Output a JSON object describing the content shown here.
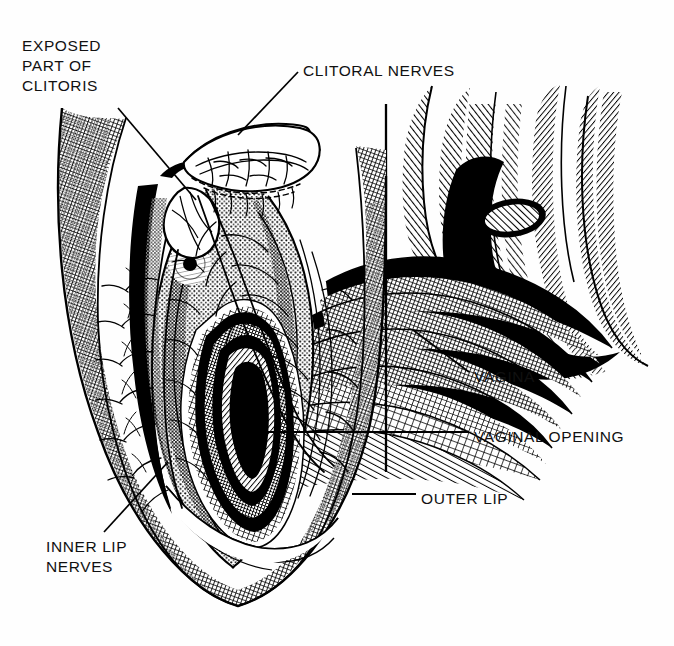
{
  "figure": {
    "type": "anatomical-line-engraving",
    "background_color": "#fefefe",
    "ink_color": "#000000",
    "labels": [
      {
        "id": "exposed-part-of-clitoris",
        "text": "EXPOSED\nPART OF\nCLITORIS",
        "x": 22,
        "y": 36
      },
      {
        "id": "clitoral-nerves",
        "text": "CLITORAL NERVES",
        "x": 303,
        "y": 61
      },
      {
        "id": "vagina",
        "text": "VAGINA",
        "x": 474,
        "y": 367
      },
      {
        "id": "vaginal-opening",
        "text": "VAGINAL OPENING",
        "x": 474,
        "y": 427
      },
      {
        "id": "outer-lip",
        "text": "OUTER LIP",
        "x": 421,
        "y": 489
      },
      {
        "id": "inner-lip-nerves",
        "text": "INNER LIP\nNERVES",
        "x": 46,
        "y": 537
      }
    ],
    "leader_lines": [
      {
        "id": "leader-clitoris",
        "from": [
          118,
          108
        ],
        "to": [
          196,
          200
        ]
      },
      {
        "id": "leader-clitoral-nerves",
        "from": [
          298,
          72
        ],
        "to": [
          238,
          135
        ]
      },
      {
        "id": "leader-vagina",
        "from": [
          469,
          372
        ],
        "to": [
          413,
          330
        ]
      },
      {
        "id": "leader-vaginal-opening",
        "from": [
          469,
          432
        ],
        "to": [
          268,
          432
        ]
      },
      {
        "id": "leader-outer-lip",
        "from": [
          416,
          494
        ],
        "to": [
          352,
          494
        ]
      },
      {
        "id": "leader-inner-lip-nerves",
        "from": [
          104,
          532
        ],
        "to": [
          168,
          462
        ]
      }
    ],
    "cut_plane_line": {
      "id": "cut-plane",
      "from": [
        386,
        104
      ],
      "to": [
        386,
        472
      ]
    }
  }
}
